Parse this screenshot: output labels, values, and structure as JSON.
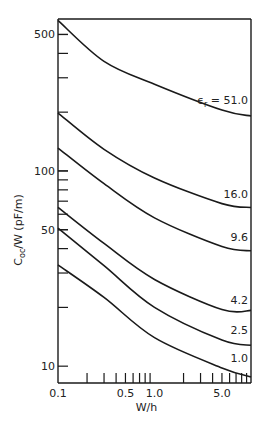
{
  "chart_data": {
    "type": "line",
    "title": "",
    "xlabel": "W/h",
    "ylabel": "C_oc/W (pF/m)",
    "ylabel_parts": {
      "main": "C",
      "sub": "oc",
      "rest": "/W (pF/m)"
    },
    "xscale": "log",
    "yscale": "log",
    "xlim": [
      0.1,
      10
    ],
    "ylim": [
      8.2,
      600
    ],
    "grid": false,
    "x_tick_labels": [
      {
        "value": 0.1,
        "label": "0.1"
      },
      {
        "value": 0.5,
        "label": "0.5"
      },
      {
        "value": 1.0,
        "label": "1.0"
      },
      {
        "value": 5.0,
        "label": "5.0"
      }
    ],
    "x_minor_ticks": [
      0.2,
      0.3,
      0.4,
      0.5,
      0.6,
      0.7,
      0.8,
      0.9,
      2,
      3,
      4,
      5,
      6,
      7,
      8,
      9
    ],
    "y_tick_labels": [
      {
        "value": 10,
        "label": "10"
      },
      {
        "value": 50,
        "label": "50"
      },
      {
        "value": 100,
        "label": "100"
      },
      {
        "value": 500,
        "label": "500"
      }
    ],
    "y_minor_ticks": [
      20,
      30,
      40,
      50,
      60,
      70,
      80,
      90,
      100,
      200,
      300,
      400,
      500
    ],
    "x": [
      0.1,
      0.3,
      1.0,
      5.0,
      10
    ],
    "series": [
      {
        "name": "εr = 51.0",
        "label": "ϵr = 51.0",
        "label_main": "ϵ",
        "label_sub": "r",
        "label_rest": " = 51.0",
        "values": [
          590,
          364,
          278,
          205,
          191
        ]
      },
      {
        "name": "16.0",
        "label": "16.0",
        "values": [
          198,
          129,
          92,
          68,
          65
        ]
      },
      {
        "name": "9.6",
        "label": "9.6",
        "values": [
          131,
          86,
          57.5,
          41,
          39
        ]
      },
      {
        "name": "4.2",
        "label": "4.2",
        "values": [
          65,
          42.5,
          27.8,
          19.5,
          19.3
        ]
      },
      {
        "name": "2.5",
        "label": "2.5",
        "values": [
          51,
          32.7,
          20,
          13.6,
          12.8
        ]
      },
      {
        "name": "1.0",
        "label": "1.0",
        "values": [
          33,
          22.5,
          14,
          9.8,
          8.8
        ]
      }
    ]
  }
}
